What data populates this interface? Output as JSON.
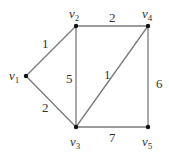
{
  "graph": {
    "type": "weighted-undirected-graph",
    "vertices": [
      {
        "id": "v1",
        "label": "v",
        "sub": "1",
        "x": 26,
        "y": 76,
        "lx": 9,
        "ly": 80
      },
      {
        "id": "v2",
        "label": "v",
        "sub": "2",
        "x": 76,
        "y": 26,
        "lx": 69,
        "ly": 18
      },
      {
        "id": "v3",
        "label": "v",
        "sub": "3",
        "x": 76,
        "y": 127,
        "lx": 70,
        "ly": 146
      },
      {
        "id": "v4",
        "label": "v",
        "sub": "4",
        "x": 148,
        "y": 26,
        "lx": 142,
        "ly": 18
      },
      {
        "id": "v5",
        "label": "v",
        "sub": "5",
        "x": 148,
        "y": 127,
        "lx": 142,
        "ly": 146
      }
    ],
    "edges": [
      {
        "from": "v1",
        "to": "v2",
        "weight": "1",
        "lx": 42,
        "ly": 48
      },
      {
        "from": "v1",
        "to": "v3",
        "weight": "2",
        "lx": 42,
        "ly": 112
      },
      {
        "from": "v2",
        "to": "v3",
        "weight": "5",
        "lx": 66,
        "ly": 83
      },
      {
        "from": "v2",
        "to": "v4",
        "weight": "2",
        "lx": 109,
        "ly": 22
      },
      {
        "from": "v3",
        "to": "v4",
        "weight": "1",
        "lx": 104,
        "ly": 79
      },
      {
        "from": "v4",
        "to": "v5",
        "weight": "6",
        "lx": 156,
        "ly": 88
      },
      {
        "from": "v3",
        "to": "v5",
        "weight": "7",
        "lx": 109,
        "ly": 142
      }
    ]
  },
  "colors": {
    "edge": "#7a7a7a",
    "vertex": "#111111",
    "text": "#333333",
    "background": "#ffffff"
  }
}
